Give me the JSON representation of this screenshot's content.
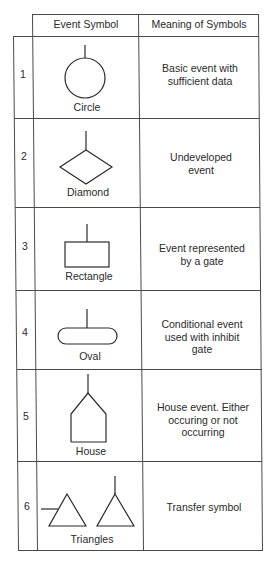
{
  "table": {
    "headers": [
      "Event Symbol",
      "Meaning of Symbols"
    ],
    "rows": [
      {
        "number": "1",
        "symbol": "Circle",
        "meaning": "Basic event with sufficient data",
        "meaning_lines": [
          "Basic event with",
          "sufficient data"
        ]
      },
      {
        "number": "2",
        "symbol": "Diamond",
        "meaning": "Undeveloped event",
        "meaning_lines": [
          "Undeveloped",
          "event"
        ]
      },
      {
        "number": "3",
        "symbol": "Rectangle",
        "meaning": "Event represented by a gate",
        "meaning_lines": [
          "Event represented",
          "by a gate"
        ]
      },
      {
        "number": "4",
        "symbol": "Oval",
        "meaning": "Conditional event used with inhibit gate",
        "meaning_lines": [
          "Conditional event",
          "used with inhibit",
          "gate"
        ]
      },
      {
        "number": "5",
        "symbol": "House",
        "meaning": "House event. Either occuring or not occurring",
        "meaning_lines": [
          "House event. Either",
          "occuring or not",
          "occurring"
        ]
      },
      {
        "number": "6",
        "symbol": "Triangles",
        "meaning": "Transfer symbol",
        "meaning_lines": [
          "Transfer symbol"
        ]
      }
    ]
  }
}
